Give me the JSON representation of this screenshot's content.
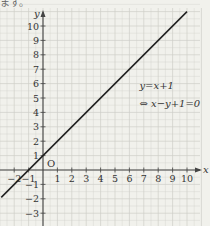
{
  "header_fragment": "ます。",
  "chart_data": {
    "type": "line",
    "title": "",
    "xlabel": "x",
    "ylabel": "y",
    "origin_label": "O",
    "xlim": [
      -3,
      10.6
    ],
    "ylim": [
      -3.9,
      11.5
    ],
    "x_ticks": [
      -2,
      -1,
      1,
      2,
      3,
      4,
      5,
      6,
      7,
      8,
      9,
      10
    ],
    "y_ticks": [
      -3,
      -2,
      -1,
      1,
      2,
      3,
      4,
      5,
      6,
      7,
      8,
      9,
      10
    ],
    "grid": true,
    "series": [
      {
        "name": "y=x+1",
        "equation": "y = x + 1",
        "x": [
          -2.9,
          10
        ],
        "y": [
          -1.9,
          11
        ]
      }
    ],
    "annotations": [
      {
        "text": "y=x+1",
        "x": 6.7,
        "y": 5.6
      },
      {
        "text": "⇔  x−y+1=0",
        "x": 6.7,
        "y": 4.4
      }
    ]
  },
  "colors": {
    "background": "#f1f1ec",
    "grid": "#cfcfc8",
    "axis": "#444444",
    "line": "#222222"
  }
}
